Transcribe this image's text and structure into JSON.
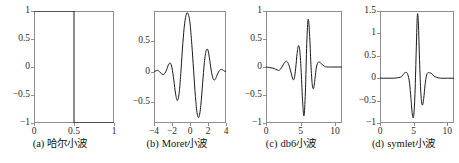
{
  "figure": {
    "background_color": "#ffffff",
    "axis_color": "#8e8e8e",
    "curve_color": "#1a1a1a",
    "panel_count": 4
  },
  "panels": [
    {
      "caption_tag": "(a)",
      "caption_text": "哈尔小波",
      "name": "haar"
    },
    {
      "caption_tag": "(b)",
      "caption_text": "Moret小波",
      "name": "morlet"
    },
    {
      "caption_tag": "(c)",
      "caption_text": "db6小波",
      "name": "db6"
    },
    {
      "caption_tag": "(d)",
      "caption_text": "symlet小波",
      "name": "symlet"
    }
  ],
  "chart_data": [
    {
      "type": "line",
      "name": "haar",
      "title": "(a) 哈尔小波",
      "xlabel": "",
      "ylabel": "",
      "xlim": [
        0,
        1
      ],
      "ylim": [
        -1,
        1
      ],
      "xticks": [
        0,
        0.5,
        1
      ],
      "xticklabels": [
        "0",
        "0.5",
        "1"
      ],
      "yticks": [
        -1,
        -0.5,
        0,
        0.5,
        1
      ],
      "yticklabels": [
        "-1",
        "-0.5",
        "0",
        "0.5",
        "1"
      ],
      "grid": false,
      "legend": "none",
      "series": [
        {
          "name": "Haar wavelet",
          "x": [
            0,
            0.5,
            0.5,
            1
          ],
          "y": [
            1,
            1,
            -1,
            -1
          ]
        }
      ]
    },
    {
      "type": "line",
      "name": "morlet",
      "title": "(b) Moret小波",
      "xlabel": "",
      "ylabel": "",
      "xlim": [
        -4,
        4
      ],
      "ylim": [
        -0.85,
        1.0
      ],
      "xticks": [
        -4,
        -2,
        0,
        2,
        4
      ],
      "xticklabels": [
        "-4",
        "-2",
        "0",
        "2",
        "4"
      ],
      "yticks": [
        -0.5,
        0,
        0.5
      ],
      "yticklabels": [
        "-0.5",
        "0",
        "0.5"
      ],
      "grid": false,
      "legend": "none",
      "series": [
        {
          "name": "Morlet wavelet",
          "x": [
            -4.0,
            -3.8,
            -3.6,
            -3.4,
            -3.2,
            -3.0,
            -2.8,
            -2.6,
            -2.4,
            -2.2,
            -2.0,
            -1.8,
            -1.6,
            -1.4,
            -1.2,
            -1.0,
            -0.8,
            -0.6,
            -0.4,
            -0.2,
            0.0,
            0.2,
            0.4,
            0.6,
            0.8,
            1.0,
            1.2,
            1.4,
            1.6,
            1.8,
            2.0,
            2.2,
            2.4,
            2.6,
            2.8,
            3.0,
            3.2,
            3.4,
            3.6,
            3.8,
            4.0
          ],
          "y": [
            0.0,
            0.01,
            0.02,
            0.0,
            -0.03,
            -0.05,
            -0.03,
            0.03,
            0.11,
            0.14,
            0.06,
            -0.14,
            -0.37,
            -0.48,
            -0.35,
            0.02,
            0.46,
            0.79,
            0.95,
            0.95,
            0.8,
            0.45,
            0.02,
            -0.41,
            -0.7,
            -0.75,
            -0.56,
            -0.2,
            0.15,
            0.35,
            0.35,
            0.18,
            -0.02,
            -0.13,
            -0.13,
            -0.06,
            0.0,
            0.03,
            0.03,
            0.01,
            0.0
          ]
        }
      ]
    },
    {
      "type": "line",
      "name": "db6",
      "title": "(c) db6小波",
      "xlabel": "",
      "ylabel": "",
      "xlim": [
        0,
        11
      ],
      "ylim": [
        -1,
        1
      ],
      "xticks": [
        0,
        5,
        10
      ],
      "xticklabels": [
        "0",
        "5",
        "10"
      ],
      "yticks": [
        -1,
        -0.5,
        0,
        0.5,
        1
      ],
      "yticklabels": [
        "-1",
        "-0.5",
        "0",
        "0.5",
        "1"
      ],
      "grid": false,
      "legend": "none",
      "series": [
        {
          "name": "db6 wavelet",
          "x": [
            0.0,
            0.5,
            1.0,
            1.4,
            1.8,
            2.1,
            2.4,
            2.7,
            3.0,
            3.3,
            3.6,
            3.9,
            4.1,
            4.3,
            4.5,
            4.7,
            4.9,
            5.1,
            5.3,
            5.5,
            5.7,
            5.9,
            6.1,
            6.3,
            6.5,
            6.7,
            6.9,
            7.1,
            7.3,
            7.6,
            8.0,
            8.5,
            9.0,
            10.0,
            11.0
          ],
          "y": [
            0.0,
            -0.01,
            -0.02,
            -0.04,
            -0.06,
            -0.04,
            0.02,
            0.08,
            0.1,
            0.04,
            -0.09,
            -0.22,
            -0.2,
            -0.02,
            0.24,
            0.38,
            0.28,
            -0.1,
            -0.62,
            -0.87,
            -0.45,
            0.42,
            0.85,
            0.6,
            0.05,
            -0.32,
            -0.38,
            -0.2,
            0.0,
            0.09,
            0.06,
            0.01,
            0.0,
            0.0,
            0.0
          ]
        }
      ]
    },
    {
      "type": "line",
      "name": "symlet",
      "title": "(d) symlet小波",
      "xlabel": "",
      "ylabel": "",
      "xlim": [
        0,
        11
      ],
      "ylim": [
        -1,
        1.5
      ],
      "xticks": [
        0,
        5,
        10
      ],
      "xticklabels": [
        "0",
        "5",
        "10"
      ],
      "yticks": [
        -1,
        -0.5,
        0,
        0.5,
        1,
        1.5
      ],
      "yticklabels": [
        "-1",
        "-0.5",
        "0",
        "0.5",
        "1",
        "1.5"
      ],
      "grid": false,
      "legend": "none",
      "series": [
        {
          "name": "symlet wavelet",
          "x": [
            0.0,
            1.0,
            2.0,
            2.6,
            3.0,
            3.3,
            3.6,
            3.8,
            4.0,
            4.2,
            4.4,
            4.6,
            4.8,
            5.0,
            5.2,
            5.4,
            5.55,
            5.7,
            5.9,
            6.1,
            6.3,
            6.5,
            6.7,
            6.9,
            7.1,
            7.4,
            7.7,
            8.0,
            8.4,
            9.0,
            10.0,
            11.0
          ],
          "y": [
            0.0,
            0.0,
            0.0,
            0.01,
            0.02,
            0.05,
            0.11,
            0.13,
            0.12,
            0.05,
            -0.12,
            -0.45,
            -0.8,
            -0.85,
            -0.35,
            0.7,
            1.4,
            1.25,
            0.3,
            -0.4,
            -0.6,
            -0.45,
            -0.15,
            0.05,
            0.12,
            0.12,
            0.1,
            0.05,
            0.02,
            0.0,
            0.0,
            0.0
          ]
        }
      ]
    }
  ]
}
